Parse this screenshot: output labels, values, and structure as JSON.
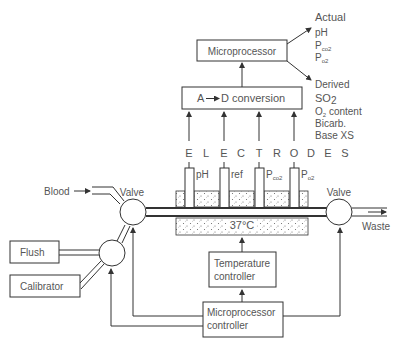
{
  "diagram": {
    "outputs": {
      "actual": {
        "heading": "Actual",
        "items": [
          "pH",
          "Pco2",
          "Po2"
        ]
      },
      "derived": {
        "heading": "Derived",
        "items": [
          "SO2",
          "O2 content",
          "Bicarb.",
          "Base XS"
        ]
      }
    },
    "boxes": {
      "microprocessor": "Microprocessor",
      "ad_conversion": "A—▸D conversion",
      "ad_a": "A",
      "ad_d": "D conversion",
      "flush": "Flush",
      "calibrator": "Calibrator",
      "temperature_controller_line1": "Temperature",
      "temperature_controller_line2": "controller",
      "microprocessor_controller_line1": "Microprocessor",
      "microprocessor_controller_line2": "controller"
    },
    "electrodes_label_letters": [
      "E",
      "L",
      "E",
      "C",
      "T",
      "R",
      "O",
      "D",
      "E",
      "S"
    ],
    "electrodes": [
      {
        "name": "pH",
        "base": "pH",
        "sub": ""
      },
      {
        "name": "ref",
        "base": "ref",
        "sub": ""
      },
      {
        "name": "Pco2",
        "base": "P",
        "sub": "co2"
      },
      {
        "name": "Po2",
        "base": "P",
        "sub": "o2"
      }
    ],
    "labels": {
      "blood": "Blood",
      "valve_left": "Valve",
      "valve_right": "Valve",
      "waste": "Waste",
      "temperature": "37°C",
      "pco2_p": "P",
      "pco2_sub": "co2",
      "po2_p": "P",
      "po2_sub": "o2",
      "so2_s": "SO",
      "so2_sub": "2",
      "o2_o": "O",
      "o2_sub": "2",
      "o2_rest": " content",
      "bicarb": "Bicarb.",
      "basexs": "Base XS",
      "ph": "pH"
    },
    "colors": {
      "line": "#333333",
      "text": "#555555",
      "background": "#ffffff"
    }
  }
}
